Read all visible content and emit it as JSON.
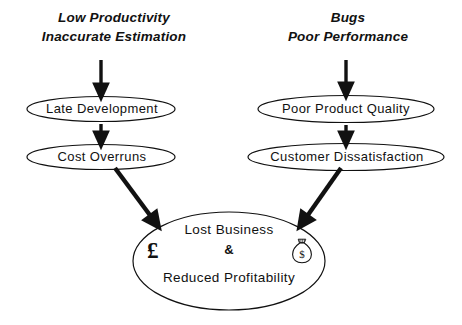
{
  "diagram": {
    "background_color": "#ffffff",
    "stroke_color": "#111111",
    "branches": {
      "left": {
        "header": {
          "line1": "Low Productivity",
          "line2": "Inaccurate Estimation"
        },
        "nodes": [
          {
            "label": "Late Development"
          },
          {
            "label": "Cost Overruns"
          }
        ]
      },
      "right": {
        "header": {
          "line1": "Bugs",
          "line2": "Poor Performance"
        },
        "nodes": [
          {
            "label": "Poor Product Quality"
          },
          {
            "label": "Customer Dissatisfaction"
          }
        ]
      }
    },
    "outcome": {
      "line1": "Lost Business",
      "conjunction": "&",
      "line3": "Reduced Profitability",
      "currency_symbol": "£",
      "money_bag_symbol": "$",
      "money_bag_icon": "money-bag-icon"
    },
    "arrows": [
      {
        "name": "arrow-left-header-to-late-development",
        "kind": "vertical-down"
      },
      {
        "name": "arrow-late-development-to-cost-overruns",
        "kind": "vertical-down"
      },
      {
        "name": "arrow-right-header-to-poor-product-quality",
        "kind": "vertical-down"
      },
      {
        "name": "arrow-poor-product-quality-to-customer-dissatisfaction",
        "kind": "vertical-down"
      },
      {
        "name": "arrow-cost-overruns-to-outcome",
        "kind": "diagonal-down-right"
      },
      {
        "name": "arrow-customer-dissatisfaction-to-outcome",
        "kind": "diagonal-down-left"
      }
    ]
  }
}
